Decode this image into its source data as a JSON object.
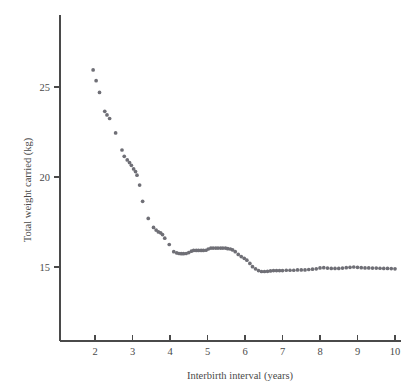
{
  "chart_data": {
    "type": "scatter",
    "title": "",
    "subtitle": "",
    "xlabel": "Interbirth interval (years)",
    "ylabel": "Total weight carried (kg)",
    "xlim": [
      1.4,
      10.25
    ],
    "ylim": [
      12.2,
      27.2
    ],
    "xticks": [
      2,
      3,
      4,
      5,
      6,
      7,
      8,
      9,
      10
    ],
    "yticks": [
      15,
      20,
      25
    ],
    "xtick_labels": [
      "2",
      "3",
      "4",
      "5",
      "6",
      "7",
      "8",
      "9",
      "10"
    ],
    "ytick_labels": [
      "15",
      "20",
      "25"
    ],
    "grid": false,
    "legend": null,
    "marker_color": "#6f6f76",
    "axis_color": "#4a4a4a",
    "background_color": "#ffffff",
    "series": [
      {
        "name": "Total weight carried",
        "x": [
          1.95,
          2.03,
          2.12,
          2.26,
          2.32,
          2.39,
          2.55,
          2.72,
          2.78,
          2.86,
          2.92,
          2.97,
          3.03,
          3.08,
          3.12,
          3.19,
          3.27,
          3.42,
          3.56,
          3.63,
          3.69,
          3.75,
          3.8,
          3.86,
          3.98,
          4.1,
          4.18,
          4.24,
          4.3,
          4.36,
          4.43,
          4.5,
          4.57,
          4.63,
          4.7,
          4.76,
          4.83,
          4.89,
          4.96,
          5.02,
          5.09,
          5.15,
          5.22,
          5.28,
          5.35,
          5.41,
          5.48,
          5.54,
          5.61,
          5.67,
          5.74,
          5.82,
          5.9,
          5.98,
          6.05,
          6.13,
          6.2,
          6.28,
          6.36,
          6.44,
          6.52,
          6.6,
          6.68,
          6.76,
          6.84,
          6.92,
          7.0,
          7.1,
          7.2,
          7.3,
          7.4,
          7.5,
          7.6,
          7.7,
          7.8,
          7.9,
          8.0,
          8.1,
          8.2,
          8.3,
          8.4,
          8.5,
          8.6,
          8.7,
          8.8,
          8.9,
          9.0,
          9.1,
          9.2,
          9.3,
          9.4,
          9.5,
          9.6,
          9.7,
          9.8,
          9.9,
          10.0
        ],
        "y": [
          25.95,
          25.35,
          24.7,
          23.65,
          23.45,
          23.25,
          22.45,
          21.5,
          21.15,
          20.95,
          20.8,
          20.65,
          20.45,
          20.3,
          20.1,
          19.55,
          18.65,
          17.7,
          17.2,
          17.05,
          16.95,
          16.9,
          16.8,
          16.6,
          16.25,
          15.85,
          15.78,
          15.75,
          15.74,
          15.74,
          15.75,
          15.8,
          15.88,
          15.92,
          15.92,
          15.92,
          15.92,
          15.92,
          15.93,
          16.0,
          16.05,
          16.05,
          16.05,
          16.05,
          16.05,
          16.05,
          16.05,
          16.02,
          16.0,
          15.95,
          15.85,
          15.7,
          15.58,
          15.48,
          15.38,
          15.2,
          15.02,
          14.9,
          14.8,
          14.75,
          14.75,
          14.76,
          14.78,
          14.8,
          14.8,
          14.8,
          14.8,
          14.82,
          14.82,
          14.82,
          14.84,
          14.84,
          14.84,
          14.86,
          14.88,
          14.9,
          14.95,
          14.96,
          14.94,
          14.92,
          14.92,
          14.92,
          14.94,
          14.96,
          14.98,
          15.0,
          14.98,
          14.96,
          14.95,
          14.95,
          14.94,
          14.94,
          14.93,
          14.92,
          14.92,
          14.91,
          14.9
        ]
      }
    ]
  }
}
